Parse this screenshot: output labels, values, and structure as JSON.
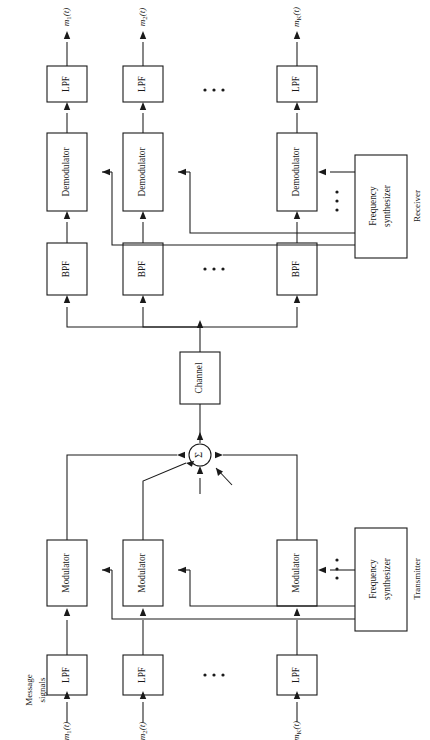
{
  "diagram": {
    "orientation": "rotated-90-ccw",
    "sections": {
      "transmitter_label": "Transmitter",
      "receiver_label": "Receiver",
      "message_label_line1": "Message",
      "message_label_line2": "signals"
    },
    "blocks": {
      "lpf": "LPF",
      "bpf": "BPF",
      "modulator": "Modulator",
      "demodulator": "Demodulator",
      "channel": "Channel",
      "freq_synth_line1": "Frequency",
      "freq_synth_line2": "synthesizer",
      "summer": "Σ"
    },
    "signals": {
      "input": [
        {
          "base": "m",
          "sub": "1",
          "arg": "(t)"
        },
        {
          "base": "m",
          "sub": "2",
          "arg": "(t)"
        },
        {
          "base": "m",
          "sub": "K",
          "arg": "(t)"
        }
      ],
      "output": [
        {
          "base": "m",
          "sub": "1",
          "arg": "(t)"
        },
        {
          "base": "m",
          "sub": "2",
          "arg": "(t)"
        },
        {
          "base": "m",
          "sub": "K",
          "arg": "(t)"
        }
      ]
    },
    "ellipsis": "· · ·",
    "colors": {
      "background": "#ffffff",
      "stroke": "#1a1a1a",
      "fill": "#ffffff"
    },
    "channel_count": 3,
    "channel_count_note": "K channels shown as 3 with ellipsis"
  }
}
